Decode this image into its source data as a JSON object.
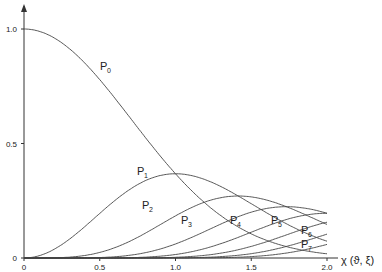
{
  "chart_data": {
    "type": "line",
    "title": "",
    "xlabel": "χ (ϑ, ξ)",
    "ylabel": "",
    "xlim": [
      0,
      2.0
    ],
    "ylim": [
      0,
      1.0
    ],
    "grid": false,
    "x_ticks": [
      "0",
      "0.5",
      "1.0",
      "1.5",
      "2.0"
    ],
    "y_ticks": [
      "0",
      "0.5",
      "1.0"
    ],
    "legend": "inline curve labels",
    "x": [
      0,
      0.1,
      0.2,
      0.3,
      0.4,
      0.5,
      0.6,
      0.7,
      0.8,
      0.9,
      1.0,
      1.1,
      1.2,
      1.3,
      1.4,
      1.5,
      1.6,
      1.7,
      1.8,
      1.9,
      2.0
    ],
    "series": [
      {
        "name": "P0",
        "label": "P",
        "sub": "0"
      },
      {
        "name": "P1",
        "label": "P",
        "sub": "1"
      },
      {
        "name": "P2",
        "label": "P",
        "sub": "2"
      },
      {
        "name": "P3",
        "label": "P",
        "sub": "3"
      },
      {
        "name": "P4",
        "label": "P",
        "sub": "4"
      },
      {
        "name": "P5",
        "label": "P",
        "sub": "5"
      },
      {
        "name": "P6",
        "label": "P",
        "sub": "6"
      },
      {
        "name": "P7",
        "label": "P",
        "sub": "7"
      }
    ],
    "note": "Curves follow P_n = (χ²)^n / n! · exp(-χ²); P0 max 1.0 at 0, P1 peak 0.37 at 1.0, P2 peak 0.27 at 1.41, P3 peak 0.22 at 1.73"
  },
  "labels": {
    "x_axis": "χ (ϑ, ξ)"
  }
}
